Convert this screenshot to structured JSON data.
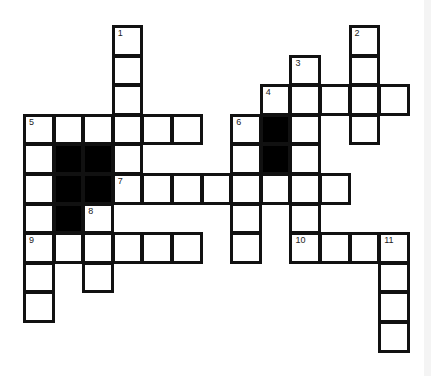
{
  "puzzle": {
    "type": "crossword",
    "grid_origin": {
      "x": 23,
      "y": 25
    },
    "cell_size": 29.6,
    "colors": {
      "border": "#111111",
      "fill": "#ffffff",
      "block": "#000000"
    },
    "cells": [
      {
        "c": 3,
        "r": 0,
        "n": "1"
      },
      {
        "c": 3,
        "r": 1
      },
      {
        "c": 3,
        "r": 2
      },
      {
        "c": 3,
        "r": 3
      },
      {
        "c": 3,
        "r": 4
      },
      {
        "c": 3,
        "r": 5,
        "n": "7"
      },
      {
        "c": 11,
        "r": 0,
        "n": "2"
      },
      {
        "c": 11,
        "r": 1
      },
      {
        "c": 11,
        "r": 2
      },
      {
        "c": 11,
        "r": 3
      },
      {
        "c": 9,
        "r": 1,
        "n": "3"
      },
      {
        "c": 9,
        "r": 2
      },
      {
        "c": 9,
        "r": 3
      },
      {
        "c": 9,
        "r": 4
      },
      {
        "c": 9,
        "r": 5
      },
      {
        "c": 9,
        "r": 7,
        "n": "10"
      },
      {
        "c": 8,
        "r": 2,
        "n": "4"
      },
      {
        "c": 10,
        "r": 2
      },
      {
        "c": 12,
        "r": 2
      },
      {
        "c": 0,
        "r": 3,
        "n": "5"
      },
      {
        "c": 1,
        "r": 3
      },
      {
        "c": 2,
        "r": 3
      },
      {
        "c": 4,
        "r": 3
      },
      {
        "c": 5,
        "r": 3
      },
      {
        "c": 0,
        "r": 4
      },
      {
        "c": 0,
        "r": 5
      },
      {
        "c": 0,
        "r": 6
      },
      {
        "c": 0,
        "r": 7,
        "n": "9"
      },
      {
        "c": 0,
        "r": 8
      },
      {
        "c": 0,
        "r": 9
      },
      {
        "c": 7,
        "r": 3,
        "n": "6"
      },
      {
        "c": 7,
        "r": 4
      },
      {
        "c": 7,
        "r": 5
      },
      {
        "c": 7,
        "r": 6
      },
      {
        "c": 7,
        "r": 7
      },
      {
        "c": 4,
        "r": 5
      },
      {
        "c": 5,
        "r": 5
      },
      {
        "c": 6,
        "r": 5
      },
      {
        "c": 8,
        "r": 5
      },
      {
        "c": 10,
        "r": 5
      },
      {
        "c": 2,
        "r": 6,
        "n": "8"
      },
      {
        "c": 2,
        "r": 7
      },
      {
        "c": 2,
        "r": 8
      },
      {
        "c": 1,
        "r": 7
      },
      {
        "c": 3,
        "r": 7
      },
      {
        "c": 4,
        "r": 7
      },
      {
        "c": 5,
        "r": 7
      },
      {
        "c": 10,
        "r": 7
      },
      {
        "c": 11,
        "r": 7
      },
      {
        "c": 12,
        "r": 7,
        "n": "11"
      },
      {
        "c": 12,
        "r": 8
      },
      {
        "c": 12,
        "r": 9
      },
      {
        "c": 12,
        "r": 10
      },
      {
        "c": 9,
        "r": 6
      }
    ],
    "blocks": [
      {
        "c": 1,
        "r": 4
      },
      {
        "c": 2,
        "r": 4
      },
      {
        "c": 1,
        "r": 5
      },
      {
        "c": 2,
        "r": 5
      },
      {
        "c": 1,
        "r": 6
      },
      {
        "c": 8,
        "r": 3
      },
      {
        "c": 8,
        "r": 4
      }
    ],
    "words": [
      {
        "number": "1",
        "direction": "down",
        "length": 6
      },
      {
        "number": "2",
        "direction": "down",
        "length": 4
      },
      {
        "number": "3",
        "direction": "down",
        "length": 7
      },
      {
        "number": "4",
        "direction": "across",
        "length": 5
      },
      {
        "number": "5",
        "direction": "across",
        "length": 6
      },
      {
        "number": "5",
        "direction": "down",
        "length": 7
      },
      {
        "number": "6",
        "direction": "down",
        "length": 5
      },
      {
        "number": "7",
        "direction": "across",
        "length": 8
      },
      {
        "number": "8",
        "direction": "down",
        "length": 3
      },
      {
        "number": "9",
        "direction": "across",
        "length": 6
      },
      {
        "number": "10",
        "direction": "across",
        "length": 4
      },
      {
        "number": "11",
        "direction": "down",
        "length": 4
      }
    ]
  }
}
